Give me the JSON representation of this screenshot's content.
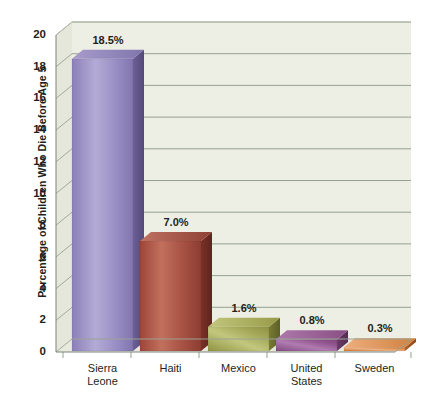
{
  "chart_data": {
    "type": "bar",
    "title": "",
    "subtitle": "",
    "xlabel": "",
    "ylabel": "Percentage of Children Who Die Before Age 5",
    "categories": [
      "Sierra\nLeone",
      "Haiti",
      "Mexico",
      "United\nStates",
      "Sweden"
    ],
    "values": [
      18.5,
      7.0,
      1.6,
      0.8,
      0.3
    ],
    "data_labels": [
      "18.5%",
      "7.0%",
      "1.6%",
      "0.8%",
      "0.3%"
    ],
    "ylim": [
      0,
      20
    ],
    "yticks": [
      0,
      2,
      4,
      6,
      8,
      10,
      12,
      14,
      16,
      18,
      20
    ],
    "ytick_labels": [
      "0",
      "2",
      "4",
      "6",
      "8",
      "10",
      "12",
      "14",
      "16",
      "18",
      "20"
    ],
    "grid": true,
    "legend": "none",
    "style": "3d-bar",
    "series": [
      {
        "name": "Percentage of Children Who Die Before Age 5",
        "values": [
          18.5,
          7.0,
          1.6,
          0.8,
          0.3
        ]
      }
    ],
    "bar_colors": {
      "Sierra Leone": "#8f83bd",
      "Haiti": "#b55a4c",
      "Mexico": "#a9ac55",
      "United States": "#9c5a9c",
      "Sweden": "#e28b45"
    },
    "palette": {
      "wall": "#edeee4",
      "floor": "#e9eade",
      "gridline": "#8c9a86",
      "axis": "#6f7a6b",
      "text": "#231f20"
    }
  }
}
